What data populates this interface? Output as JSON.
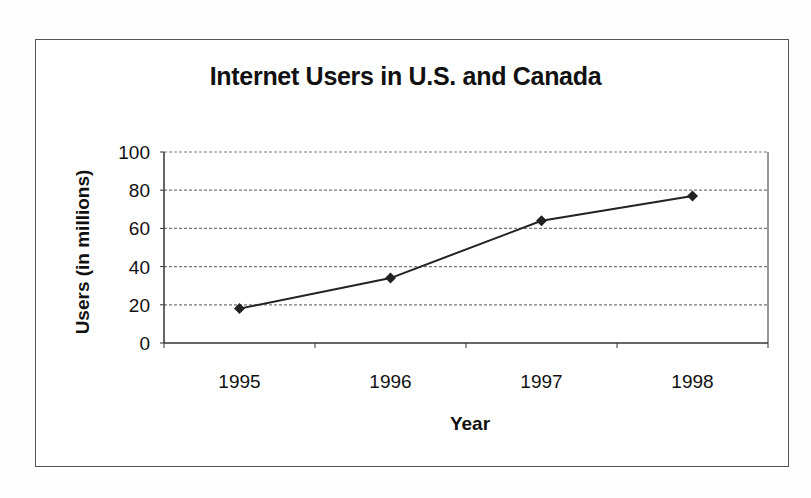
{
  "chart_data": {
    "type": "line",
    "title": "Internet Users in U.S. and Canada",
    "xlabel": "Year",
    "ylabel": "Users (in millions)",
    "categories": [
      "1995",
      "1996",
      "1997",
      "1998"
    ],
    "series": [
      {
        "name": "Internet Users",
        "values": [
          18,
          34,
          64,
          77
        ],
        "color": "#222222",
        "marker": "diamond"
      }
    ],
    "ylim": [
      0,
      100
    ],
    "yticks": [
      0,
      20,
      40,
      60,
      80,
      100
    ],
    "grid": {
      "horizontal": true,
      "style": "dotted"
    },
    "legend": null
  },
  "colors": {
    "line": "#222222",
    "grid": "#777777",
    "axis": "#333333",
    "frame": "#555555"
  }
}
